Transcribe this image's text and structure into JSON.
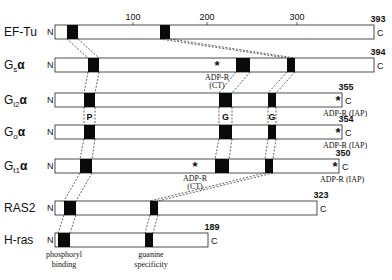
{
  "diagram": {
    "axis_ticks": [
      {
        "label": "100",
        "x": 133
      },
      {
        "label": "200",
        "x": 207
      },
      {
        "label": "300",
        "x": 297
      }
    ],
    "proteins": [
      {
        "name": "EF-Tu",
        "sub": "",
        "tail": "",
        "length": "393",
        "y": 25,
        "x_end": 374,
        "blocks": [
          [
            67,
            78
          ],
          [
            160,
            170
          ]
        ],
        "n_label": "N",
        "c_label": "C"
      },
      {
        "name": "G",
        "sub": "s",
        "tail": "α",
        "length": "394",
        "y": 58,
        "x_end": 374,
        "blocks": [
          [
            88,
            99
          ],
          [
            236,
            250
          ],
          [
            287,
            295
          ]
        ],
        "n_label": "N",
        "c_label": "C",
        "annotation": {
          "text": "ADP-R",
          "text2": "(CT)",
          "x": 217
        }
      },
      {
        "name": "G",
        "sub": "i2",
        "tail": "α",
        "length": "355",
        "y": 93,
        "x_end": 342,
        "blocks": [
          [
            84,
            95
          ],
          [
            219,
            232
          ],
          [
            268,
            276
          ]
        ],
        "n_label": "N",
        "c_label": "C",
        "annotation_c": {
          "text": "ADP-R (IAP)"
        }
      },
      {
        "name": "G",
        "sub": "o",
        "tail": "α",
        "length": "354",
        "y": 125,
        "x_end": 342,
        "blocks": [
          [
            84,
            95
          ],
          [
            219,
            232
          ],
          [
            268,
            276
          ]
        ],
        "n_label": "N",
        "c_label": "C",
        "annotation_c": {
          "text": "ADP-R (IAP)"
        }
      },
      {
        "name": "G",
        "sub": "t1",
        "tail": "α",
        "length": "350",
        "y": 159,
        "x_end": 339,
        "blocks": [
          [
            80,
            92
          ],
          [
            215,
            229
          ],
          [
            265,
            273
          ]
        ],
        "n_label": "N",
        "c_label": "C",
        "annotation": {
          "text": "ADP-R",
          "text2": "(CT)",
          "x": 195
        },
        "annotation_c": {
          "text": "ADP-R (IAP)"
        }
      },
      {
        "name": "RAS2",
        "sub": "",
        "tail": "",
        "length": "323",
        "y": 201,
        "x_end": 317,
        "blocks": [
          [
            64,
            76
          ],
          [
            150,
            158
          ]
        ],
        "n_label": "N",
        "c_label": "C"
      },
      {
        "name": "H-ras",
        "sub": "",
        "tail": "",
        "length": "189",
        "y": 233,
        "x_end": 208,
        "blocks": [
          [
            58,
            70
          ],
          [
            145,
            153
          ]
        ],
        "n_label": "N",
        "c_label": "C"
      }
    ],
    "region_labels": {
      "p": "P",
      "g1": "G",
      "g2": "G"
    },
    "bottom_labels": {
      "phosphoryl_line1": "phosphoryl",
      "phosphoryl_line2": "binding",
      "guanine_line1": "guanine",
      "guanine_line2": "specificity"
    }
  }
}
